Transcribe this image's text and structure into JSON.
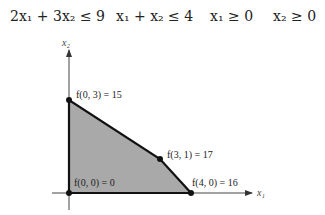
{
  "constraints": [
    {
      "text": "2x₁ + 3x₂ ≤ 9"
    },
    {
      "text": "x₁ + x₂ ≤ 4"
    },
    {
      "text": "x₁ ≥ 0"
    },
    {
      "text": "x₂ ≥ 0"
    }
  ],
  "axes": {
    "x_label": "x₁",
    "y_label": "x₂"
  },
  "vertices": [
    {
      "label": "f(0, 3) = 15",
      "x": 0,
      "y": 3,
      "value": 15
    },
    {
      "label": "f(3, 1) = 17",
      "x": 3,
      "y": 1,
      "value": 17
    },
    {
      "label": "f(4, 0) = 16",
      "x": 4,
      "y": 0,
      "value": 16
    },
    {
      "label": "f(0, 0) = 0",
      "x": 0,
      "y": 0,
      "value": 0
    }
  ],
  "colors": {
    "region_fill": "#a9a9a9",
    "boundary": "#111111",
    "axis": "#444444"
  }
}
